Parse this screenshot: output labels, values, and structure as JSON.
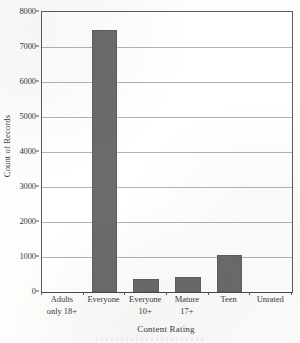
{
  "chart_data": {
    "type": "bar",
    "title": "",
    "xlabel": "Content Rating",
    "ylabel": "Count of Records",
    "categories": [
      "Adults only 18+",
      "Everyone",
      "Everyone 10+",
      "Mature 17+",
      "Teen",
      "Unrated"
    ],
    "category_lines": [
      [
        "Adults",
        "only 18+"
      ],
      [
        "Everyone",
        ""
      ],
      [
        "Everyone",
        "10+"
      ],
      [
        "Mature",
        "17+"
      ],
      [
        "Teen",
        ""
      ],
      [
        "Unrated",
        ""
      ]
    ],
    "values": [
      0,
      7480,
      370,
      430,
      1060,
      0
    ],
    "ylim": [
      0,
      8000
    ],
    "ytick_values": [
      0,
      1000,
      2000,
      3000,
      4000,
      5000,
      6000,
      7000,
      8000
    ],
    "ytick_labels": [
      "0",
      "1000",
      "2000",
      "3000",
      "4000",
      "5000",
      "6000",
      "7000",
      "8000"
    ],
    "grid": true,
    "legend": "none",
    "bar_color": "#6b6b6b",
    "axis_color": "#5a5a5a",
    "grid_color": "#9a9a9a",
    "background": "#ffffff"
  }
}
